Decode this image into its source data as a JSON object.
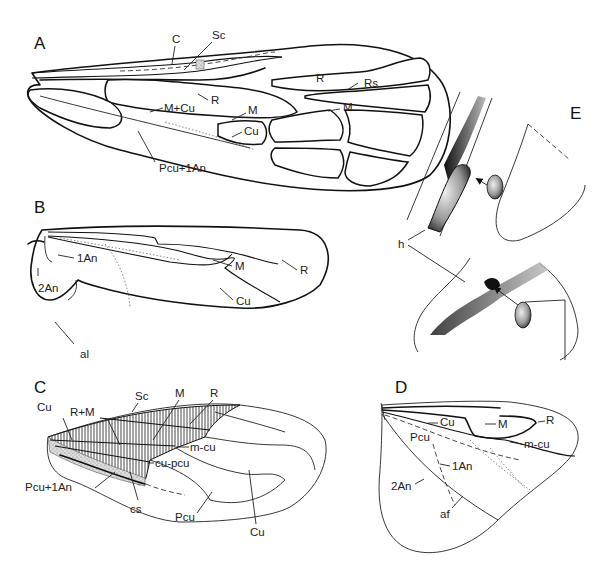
{
  "figure": {
    "panels": [
      {
        "id": "A",
        "letter": "A",
        "labels": [
          "C",
          "Sc",
          "R",
          "Rs",
          "M+Cu",
          "M",
          "M",
          "Cu",
          "Pcu+1An"
        ]
      },
      {
        "id": "B",
        "letter": "B",
        "labels": [
          "1An",
          "2An",
          "M",
          "R",
          "Cu",
          "al"
        ]
      },
      {
        "id": "C",
        "letter": "C",
        "labels": [
          "R+M",
          "Sc",
          "M",
          "R",
          "Cu",
          "m-cu",
          "cu-pcu",
          "Pcu+1An",
          "cs",
          "Pcu",
          "Cu"
        ]
      },
      {
        "id": "D",
        "letter": "D",
        "labels": [
          "Cu",
          "M",
          "R",
          "Pcu",
          "m-cu",
          "1An",
          "2An",
          "af"
        ]
      },
      {
        "id": "E",
        "letter": "E",
        "labels": [
          "h"
        ]
      }
    ]
  }
}
